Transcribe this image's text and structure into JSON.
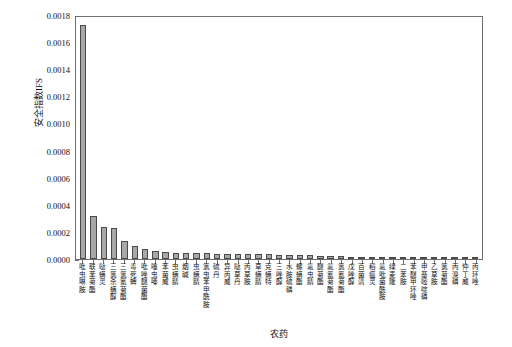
{
  "chart_data": {
    "type": "bar",
    "title": "",
    "xlabel": "农药",
    "ylabel": "安全指数IFS",
    "ylim": [
      0.0,
      0.0018
    ],
    "ytick_labels": [
      "0.0000",
      "0.0002",
      "0.0004",
      "0.0006",
      "0.0008",
      "0.0010",
      "0.0012",
      "0.0014",
      "0.0016",
      "0.0018"
    ],
    "ytick_values": [
      0.0,
      0.0002,
      0.0004,
      0.0006,
      0.0008,
      0.001,
      0.0012,
      0.0014,
      0.0016,
      0.0018
    ],
    "grid": false,
    "legend": "none",
    "bar_color": "#a8a8a8",
    "bar_edge_color": "#4a4a4a",
    "categories": [
      "吡虫啉胺",
      "联苯菊酯",
      "哒螨灵",
      "三氯杀螨醇",
      "三氯氰菊酯",
      "毒死蜱",
      "吡唑醚菌酯",
      "噻虫嗪",
      "苯菌威",
      "虫螨腈",
      "烟碱",
      "虫螨腈",
      "氯虫苯甲酰胺",
      "硫丹",
      "异丙威",
      "哒草丹",
      "丙草胺",
      "草螨腈",
      "克螨特",
      "三唑醇",
      "水胺硫磷",
      "螺螨酯",
      "氟虫腈",
      "醚菊酯",
      "氟氰菊酯",
      "氯氰菊酯",
      "戊唑醇",
      "百菌清",
      "稻瘟灵",
      "氟吡菌酰胺",
      "绿麦隆",
      "二苯胺",
      "苯醚甲环唑",
      "甲基嘧啶磷",
      "乙草胺",
      "氯菊酯",
      "丙溴磷",
      "仲丁威",
      "丙环唑"
    ],
    "values": [
      0.00173,
      0.00032,
      0.000238,
      0.000228,
      0.00013,
      9.8e-05,
      7.2e-05,
      6.1e-05,
      5.3e-05,
      4.8e-05,
      4.5e-05,
      4.4e-05,
      4.2e-05,
      4e-05,
      3.8e-05,
      3.7e-05,
      3.6e-05,
      3.5e-05,
      3.4e-05,
      3.3e-05,
      3.2e-05,
      3.1e-05,
      3e-05,
      2.2e-05,
      2e-05,
      1.9e-05,
      1.8e-05,
      1.7e-05,
      1.6e-05,
      1.5e-05,
      1.4e-05,
      1.3e-05,
      1.2e-05,
      1.1e-05,
      1e-05,
      9e-06,
      8e-06,
      7e-06,
      6e-06
    ]
  }
}
